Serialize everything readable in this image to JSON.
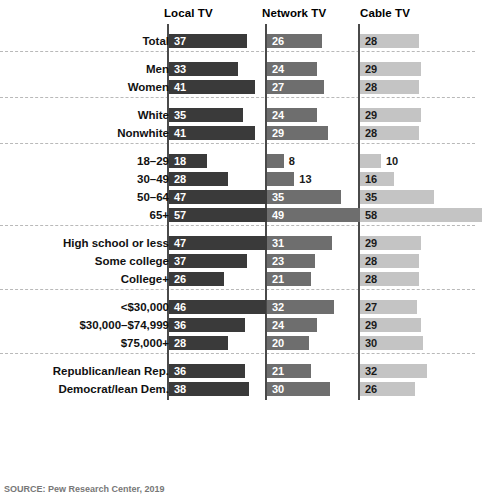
{
  "chart_data": {
    "type": "bar",
    "orientation": "horizontal",
    "title": "",
    "xlabel": "",
    "ylabel": "",
    "xlim": [
      0,
      60
    ],
    "grid": false,
    "legend_position": "top-as-column-headers",
    "value_unit": "percent",
    "categories": [
      "Total",
      "Men",
      "Women",
      "White",
      "Nonwhite",
      "18–29",
      "30–49",
      "50–64",
      "65+",
      "High school or less",
      "Some college",
      "College+",
      "<$30,000",
      "$30,000–$74,999",
      "$75,000+",
      "Republican/lean Rep.",
      "Democrat/lean Dem."
    ],
    "group_breaks_after": [
      0,
      2,
      4,
      8,
      11,
      14
    ],
    "series": [
      {
        "name": "Local TV",
        "color": "#3a3a3a",
        "values": [
          37,
          33,
          41,
          35,
          41,
          18,
          28,
          47,
          57,
          47,
          37,
          26,
          46,
          36,
          28,
          36,
          38
        ]
      },
      {
        "name": "Network TV",
        "color": "#6e6e6e",
        "values": [
          26,
          24,
          27,
          24,
          29,
          8,
          13,
          35,
          49,
          31,
          23,
          21,
          32,
          24,
          20,
          21,
          30
        ]
      },
      {
        "name": "Cable TV",
        "color": "#c4c4c4",
        "values": [
          28,
          29,
          28,
          29,
          28,
          10,
          16,
          35,
          58,
          29,
          28,
          28,
          27,
          29,
          30,
          32,
          26
        ]
      }
    ]
  },
  "headers": [
    {
      "label": "Local TV"
    },
    {
      "label": "Network TV"
    },
    {
      "label": "Cable TV"
    }
  ],
  "source": {
    "text": "SOURCE: Pew Research Center, 2019"
  }
}
